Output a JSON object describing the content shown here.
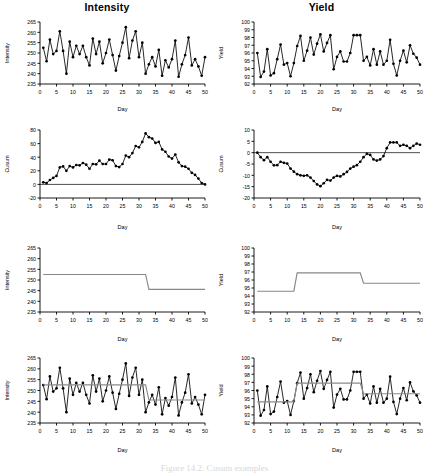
{
  "figure": {
    "caption": "Figure 14.2. Cusum examples",
    "columns": [
      "Intensity",
      "Yield"
    ],
    "xlabel": "Day"
  },
  "chart_data": [
    {
      "id": "intensity-raw",
      "type": "line",
      "title": "Intensity",
      "xlabel": "Day",
      "ylabel": "Intensity",
      "xlim": [
        0,
        50
      ],
      "ylim": [
        235,
        265
      ],
      "xticks": [
        0,
        5,
        10,
        15,
        20,
        25,
        30,
        35,
        40,
        45,
        50
      ],
      "yticks": [
        235,
        240,
        245,
        250,
        255,
        260,
        265
      ],
      "grid": false,
      "markers": "filled-circle",
      "x": [
        1,
        2,
        3,
        4,
        5,
        6,
        7,
        8,
        9,
        10,
        11,
        12,
        13,
        14,
        15,
        16,
        17,
        18,
        19,
        20,
        21,
        22,
        23,
        24,
        25,
        26,
        27,
        28,
        29,
        30,
        31,
        32,
        33,
        34,
        35,
        36,
        37,
        38,
        39,
        40,
        41,
        42,
        43,
        44,
        45,
        46,
        47,
        48,
        49,
        50
      ],
      "values": [
        252.5,
        246.0,
        256.5,
        249.5,
        251.0,
        260.5,
        251.0,
        240.0,
        255.5,
        248.0,
        253.5,
        249.5,
        253.5,
        248.0,
        244.0,
        257.0,
        249.5,
        255.5,
        245.0,
        250.0,
        256.5,
        249.0,
        241.5,
        248.5,
        255.0,
        262.5,
        247.5,
        256.0,
        260.5,
        248.0,
        255.0,
        240.0,
        244.5,
        248.0,
        243.5,
        251.5,
        239.0,
        246.5,
        243.0,
        247.0,
        256.0,
        238.5,
        244.5,
        249.0,
        257.5,
        244.0,
        247.0,
        243.5,
        239.0,
        248.0
      ]
    },
    {
      "id": "yield-raw",
      "type": "line",
      "title": "Yield",
      "xlabel": "Day",
      "ylabel": "Yield",
      "xlim": [
        0,
        50
      ],
      "ylim": [
        92,
        100
      ],
      "xticks": [
        0,
        5,
        10,
        15,
        20,
        25,
        30,
        35,
        40,
        45,
        50
      ],
      "yticks": [
        92,
        93,
        94,
        95,
        96,
        97,
        98,
        99,
        100
      ],
      "grid": false,
      "markers": "filled-circle",
      "x": [
        1,
        2,
        3,
        4,
        5,
        6,
        7,
        8,
        9,
        10,
        11,
        12,
        13,
        14,
        15,
        16,
        17,
        18,
        19,
        20,
        21,
        22,
        23,
        24,
        25,
        26,
        27,
        28,
        29,
        30,
        31,
        32,
        33,
        34,
        35,
        36,
        37,
        38,
        39,
        40,
        41,
        42,
        43,
        44,
        45,
        46,
        47,
        48,
        49,
        50
      ],
      "values": [
        96.0,
        92.9,
        93.6,
        96.5,
        93.1,
        93.4,
        95.2,
        97.1,
        94.5,
        94.7,
        93.0,
        94.7,
        96.9,
        98.2,
        95.0,
        96.3,
        98.0,
        95.8,
        97.2,
        98.4,
        96.2,
        97.3,
        98.3,
        93.9,
        95.5,
        96.2,
        94.9,
        94.9,
        96.0,
        98.3,
        98.3,
        98.3,
        95.0,
        95.5,
        94.4,
        96.5,
        94.5,
        96.2,
        94.5,
        95.0,
        97.7,
        94.6,
        93.1,
        95.0,
        96.3,
        94.8,
        97.0,
        95.9,
        95.4,
        94.5
      ]
    },
    {
      "id": "intensity-cusum",
      "type": "line",
      "title": "",
      "xlabel": "Day",
      "ylabel": "Cusum",
      "xlim": [
        0,
        50
      ],
      "ylim": [
        -20,
        80
      ],
      "xticks": [
        0,
        5,
        10,
        15,
        20,
        25,
        30,
        35,
        40,
        45,
        50
      ],
      "yticks": [
        -20,
        0,
        20,
        40,
        60,
        80
      ],
      "grid": false,
      "markers": "filled-circle",
      "x": [
        1,
        2,
        3,
        4,
        5,
        6,
        7,
        8,
        9,
        10,
        11,
        12,
        13,
        14,
        15,
        16,
        17,
        18,
        19,
        20,
        21,
        22,
        23,
        24,
        25,
        26,
        27,
        28,
        29,
        30,
        31,
        32,
        33,
        34,
        35,
        36,
        37,
        38,
        39,
        40,
        41,
        42,
        43,
        44,
        45,
        46,
        47,
        48,
        49,
        50
      ],
      "values": [
        3.0,
        -1.0,
        4.5,
        3.0,
        3.0,
        12.5,
        12.5,
        2.0,
        7.0,
        5.0,
        8.0,
        7.0,
        10.0,
        7.5,
        1.0,
        7.5,
        6.5,
        11.5,
        6.0,
        5.5,
        11.5,
        10.0,
        1.0,
        -0.5,
        4.5,
        16.5,
        13.5,
        19.0,
        29.0,
        26.5,
        31.0,
        20.5,
        15.0,
        12.5,
        6.0,
        7.0,
        -4.0,
        -7.0,
        -14.0,
        -16.5,
        -10.0,
        -21.0,
        -26.0,
        -26.5,
        -18.5,
        -24.0,
        -26.5,
        -32.5,
        -43.0,
        -44.5
      ],
      "cumulative": [
        3.0,
        2.0,
        6.5,
        9.5,
        12.5,
        25.0,
        26.5,
        20.0,
        27.0,
        25.0,
        28.5,
        28.0,
        31.5,
        29.0,
        23.0,
        30.0,
        29.5,
        35.0,
        30.0,
        30.0,
        36.5,
        35.5,
        27.0,
        25.5,
        30.0,
        42.5,
        40.0,
        46.0,
        56.5,
        54.5,
        62.5,
        75.0,
        69.5,
        67.5,
        61.0,
        62.5,
        51.5,
        48.0,
        41.0,
        38.0,
        44.0,
        32.5,
        27.0,
        26.0,
        23.0,
        17.0,
        14.0,
        8.5,
        2.0,
        0.0
      ]
    },
    {
      "id": "yield-cusum",
      "type": "line",
      "title": "",
      "xlabel": "Day",
      "ylabel": "Cusum",
      "xlim": [
        0,
        50
      ],
      "ylim": [
        -20,
        10
      ],
      "xticks": [
        0,
        5,
        10,
        15,
        20,
        25,
        30,
        35,
        40,
        45,
        50
      ],
      "yticks": [
        -20,
        -15,
        -10,
        -5,
        0,
        5,
        10
      ],
      "grid": false,
      "markers": "filled-circle",
      "cumulative": [
        0.0,
        -2.2,
        -3.7,
        -2.3,
        -4.3,
        -6.0,
        -5.9,
        -4.0,
        -4.6,
        -5.0,
        -7.1,
        -8.5,
        -7.7,
        -4.6,
        -4.7,
        -3.5,
        -0.6,
        -0.9,
        0.2,
        3.5,
        4.6,
        6.8,
        10.0,
        9.0,
        9.4,
        10.5,
        10.3,
        10.1,
        11.0,
        14.2,
        17.4,
        20.6,
        20.5,
        21.0,
        20.3,
        21.7,
        21.1,
        22.2,
        21.6,
        21.5,
        24.1,
        23.6,
        21.6,
        21.5,
        22.8,
        22.5,
        24.5,
        25.4,
        25.8,
        25.3
      ],
      "values": [
        0.0,
        -2.2,
        -3.7,
        -2.3,
        -4.3,
        -6.0,
        -5.9,
        -4.0,
        -4.6,
        -5.0,
        -7.1,
        -8.5,
        -7.7,
        -4.6,
        -4.7,
        -3.5,
        -0.6,
        -0.9,
        0.2,
        3.5,
        4.6,
        6.8,
        10.0,
        9.0,
        9.4,
        10.5,
        10.3,
        10.1,
        11.0,
        14.2,
        17.4,
        20.6,
        20.5,
        21.0,
        20.3,
        21.7,
        21.1,
        22.2,
        21.6,
        21.5,
        24.1,
        23.6,
        21.6,
        21.5,
        22.8,
        22.5,
        24.5,
        25.4,
        25.8,
        25.3
      ],
      "plotted": [
        0.0,
        -2.0,
        -3.3,
        -2.0,
        -4.0,
        -5.6,
        -5.5,
        -4.0,
        -4.5,
        -4.8,
        -7.0,
        -8.4,
        -9.5,
        -10.0,
        -10.2,
        -10.0,
        -11.0,
        -12.5,
        -14.0,
        -14.8,
        -13.5,
        -12.0,
        -12.3,
        -11.0,
        -10.2,
        -10.5,
        -9.5,
        -8.5,
        -7.0,
        -6.2,
        -5.5,
        -4.0,
        -2.0,
        -0.5,
        -1.0,
        -3.0,
        -3.5,
        -3.0,
        -1.5,
        2.0,
        4.5,
        4.5,
        4.5,
        3.0,
        3.5,
        3.0,
        2.0,
        3.0,
        4.0,
        3.5
      ]
    },
    {
      "id": "intensity-step",
      "type": "line",
      "title": "",
      "xlabel": "Day",
      "ylabel": "Intensity",
      "xlim": [
        0,
        50
      ],
      "ylim": [
        235,
        265
      ],
      "xticks": [
        0,
        5,
        10,
        15,
        20,
        25,
        30,
        35,
        40,
        45,
        50
      ],
      "yticks": [
        235,
        240,
        245,
        250,
        255,
        260,
        265
      ],
      "grid": false,
      "markers": "none",
      "line_color": "#888888",
      "segments": [
        {
          "x_start": 1,
          "x_end": 32,
          "level": 252.6
        },
        {
          "x_start": 33,
          "x_end": 50,
          "level": 245.6
        }
      ],
      "changepoints": [
        32
      ]
    },
    {
      "id": "yield-step",
      "type": "line",
      "title": "",
      "xlabel": "Day",
      "ylabel": "Yield",
      "xlim": [
        0,
        50
      ],
      "ylim": [
        92,
        100
      ],
      "xticks": [
        0,
        5,
        10,
        15,
        20,
        25,
        30,
        35,
        40,
        45,
        50
      ],
      "yticks": [
        92,
        93,
        94,
        95,
        96,
        97,
        98,
        99,
        100
      ],
      "grid": false,
      "markers": "none",
      "line_color": "#888888",
      "segments": [
        {
          "x_start": 1,
          "x_end": 12,
          "level": 94.6
        },
        {
          "x_start": 13,
          "x_end": 32,
          "level": 96.9
        },
        {
          "x_start": 33,
          "x_end": 50,
          "level": 95.6
        }
      ],
      "changepoints": [
        12,
        32
      ]
    },
    {
      "id": "intensity-overlay",
      "type": "line",
      "title": "",
      "xlabel": "Day",
      "ylabel": "Intensity",
      "xlim": [
        0,
        50
      ],
      "ylim": [
        235,
        265
      ],
      "xticks": [
        0,
        5,
        10,
        15,
        20,
        25,
        30,
        35,
        40,
        45,
        50
      ],
      "yticks": [
        235,
        240,
        245,
        250,
        255,
        260,
        265
      ],
      "grid": false,
      "markers": "filled-circle",
      "series": [
        {
          "name": "Intensity",
          "values": [
            252.5,
            246.0,
            256.5,
            249.5,
            251.0,
            260.5,
            251.0,
            240.0,
            255.5,
            248.0,
            253.5,
            249.5,
            253.5,
            248.0,
            244.0,
            257.0,
            249.5,
            255.5,
            245.0,
            250.0,
            256.5,
            249.0,
            241.5,
            248.5,
            255.0,
            262.5,
            247.5,
            256.0,
            260.5,
            248.0,
            255.0,
            240.0,
            244.5,
            248.0,
            243.5,
            251.5,
            239.0,
            246.5,
            243.0,
            247.0,
            256.0,
            238.5,
            244.5,
            249.0,
            257.5,
            244.0,
            247.0,
            243.5,
            239.0,
            248.0
          ]
        }
      ],
      "segments": [
        {
          "x_start": 1,
          "x_end": 32,
          "level": 252.6
        },
        {
          "x_start": 33,
          "x_end": 50,
          "level": 245.6
        }
      ]
    },
    {
      "id": "yield-overlay",
      "type": "line",
      "title": "",
      "xlabel": "Day",
      "ylabel": "Yield",
      "xlim": [
        0,
        50
      ],
      "ylim": [
        92,
        100
      ],
      "xticks": [
        0,
        5,
        10,
        15,
        20,
        25,
        30,
        35,
        40,
        45,
        50
      ],
      "yticks": [
        92,
        93,
        94,
        95,
        96,
        97,
        98,
        99,
        100
      ],
      "grid": false,
      "markers": "filled-circle",
      "series": [
        {
          "name": "Yield",
          "values": [
            96.0,
            92.9,
            93.6,
            96.5,
            93.1,
            93.4,
            95.2,
            97.1,
            94.5,
            94.7,
            93.0,
            94.7,
            96.9,
            98.2,
            95.0,
            96.3,
            98.0,
            95.8,
            97.2,
            98.4,
            96.2,
            97.3,
            98.3,
            93.9,
            95.5,
            96.2,
            94.9,
            94.9,
            96.0,
            98.3,
            98.3,
            98.3,
            95.0,
            95.5,
            94.4,
            96.5,
            94.5,
            96.2,
            94.5,
            95.0,
            97.7,
            94.6,
            93.1,
            95.0,
            96.3,
            94.8,
            97.0,
            95.9,
            95.4,
            94.5
          ]
        }
      ],
      "segments": [
        {
          "x_start": 1,
          "x_end": 12,
          "level": 94.6
        },
        {
          "x_start": 13,
          "x_end": 32,
          "level": 96.9
        },
        {
          "x_start": 33,
          "x_end": 50,
          "level": 95.6
        }
      ]
    }
  ]
}
